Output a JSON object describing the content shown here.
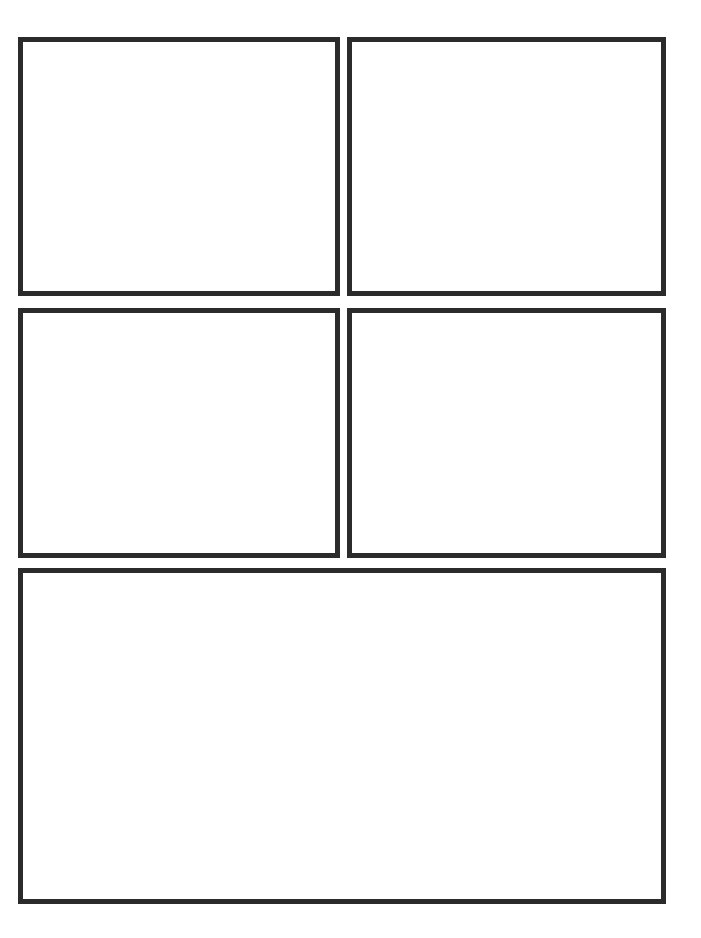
{
  "page": {
    "width": 701,
    "height": 938,
    "background_color": "#ffffff",
    "border_color": "#2b2b2b"
  },
  "panels": [
    {
      "id": "panel-top-left",
      "label": "",
      "row": 1,
      "column": 1,
      "content": "",
      "x": 18,
      "y": 37,
      "width": 322,
      "height": 259,
      "border_width": 5,
      "border_color": "#2b2b2b",
      "fill_color": "#ffffff"
    },
    {
      "id": "panel-top-right",
      "label": "",
      "row": 1,
      "column": 2,
      "content": "",
      "x": 347,
      "y": 37,
      "width": 319,
      "height": 259,
      "border_width": 5,
      "border_color": "#2b2b2b",
      "fill_color": "#ffffff"
    },
    {
      "id": "panel-middle-left",
      "label": "",
      "row": 2,
      "column": 1,
      "content": "",
      "x": 18,
      "y": 308,
      "width": 322,
      "height": 250,
      "border_width": 5,
      "border_color": "#2b2b2b",
      "fill_color": "#ffffff"
    },
    {
      "id": "panel-middle-right",
      "label": "",
      "row": 2,
      "column": 2,
      "content": "",
      "x": 347,
      "y": 308,
      "width": 319,
      "height": 250,
      "border_width": 5,
      "border_color": "#2b2b2b",
      "fill_color": "#ffffff"
    },
    {
      "id": "panel-bottom-wide",
      "label": "",
      "row": 3,
      "column": 1,
      "content": "",
      "x": 18,
      "y": 568,
      "width": 648,
      "height": 336,
      "border_width": 5,
      "border_color": "#2b2b2b",
      "fill_color": "#ffffff"
    }
  ]
}
